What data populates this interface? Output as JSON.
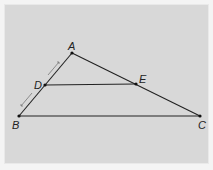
{
  "diagram": {
    "type": "triangle-midsegment",
    "background_color": "#d8d8d8",
    "line_color": "#222222",
    "points": {
      "A": {
        "label": "A",
        "x": 72,
        "y": 53
      },
      "B": {
        "label": "B",
        "x": 19,
        "y": 116
      },
      "C": {
        "label": "C",
        "x": 200,
        "y": 116
      },
      "D": {
        "label": "D",
        "x": 45,
        "y": 85
      },
      "E": {
        "label": "E",
        "x": 136,
        "y": 84
      }
    },
    "segments": [
      "AB",
      "AC",
      "BC",
      "DE"
    ],
    "markings": [
      {
        "segment": "AD",
        "style": "dimension-arrow",
        "meaning": "congruent"
      },
      {
        "segment": "DB",
        "style": "dimension-arrow",
        "meaning": "congruent"
      }
    ]
  }
}
